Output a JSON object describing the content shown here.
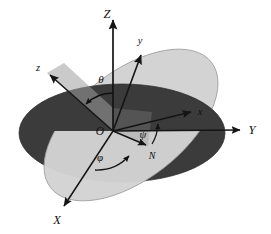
{
  "figure": {
    "name": "euler-angles-diagram",
    "background_color": "#ffffff"
  },
  "colors": {
    "fixed_plane_fill": "#3b3b3b",
    "body_plane_fill": "#d3d3d3",
    "body_plane_stroke": "#9a9a9a",
    "axis_stroke": "#151515",
    "sector_fill": "#9f9f9f",
    "ink": "#111111"
  },
  "origin": {
    "label": "O",
    "x": 113,
    "y": 131
  },
  "axes": [
    {
      "key": "Z",
      "label": "Z",
      "kind": "fixed",
      "label_x": 107,
      "label_y": 18,
      "tip_x": 113,
      "tip_y": 17,
      "tail_x": 113,
      "tail_y": 131
    },
    {
      "key": "Y",
      "label": "Y",
      "kind": "fixed",
      "label_x": 252,
      "label_y": 134,
      "tip_x": 243,
      "tip_y": 130,
      "tail_x": 113,
      "tail_y": 131
    },
    {
      "key": "X",
      "label": "X",
      "kind": "fixed",
      "label_x": 57,
      "label_y": 224,
      "tip_x": 62,
      "tip_y": 208,
      "tail_x": 113,
      "tail_y": 131
    },
    {
      "key": "z",
      "label": "z",
      "kind": "body",
      "label_x": 38,
      "label_y": 71,
      "tip_x": 47,
      "tip_y": 73,
      "tail_x": 113,
      "tail_y": 131
    },
    {
      "key": "y",
      "label": "y",
      "kind": "body",
      "label_x": 140,
      "label_y": 44,
      "tip_x": 143,
      "tip_y": 52,
      "tail_x": 113,
      "tail_y": 131
    },
    {
      "key": "x",
      "label": "x",
      "kind": "body",
      "label_x": 200,
      "label_y": 115,
      "tip_x": 194,
      "tip_y": 112,
      "tail_x": 113,
      "tail_y": 131
    },
    {
      "key": "N",
      "label": "N",
      "kind": "node",
      "label_x": 152,
      "label_y": 159,
      "tip_x": 148,
      "tip_y": 146,
      "tail_x": 113,
      "tail_y": 131
    }
  ],
  "angles": [
    {
      "key": "theta",
      "label": "θ",
      "label_x": 101,
      "label_y": 83,
      "between": [
        "Z",
        "z"
      ]
    },
    {
      "key": "phi",
      "label": "φ",
      "label_x": 100,
      "label_y": 157,
      "between": [
        "X",
        "N"
      ]
    },
    {
      "key": "psi",
      "label": "ψ",
      "label_x": 142,
      "label_y": 137,
      "between": [
        "N",
        "x"
      ]
    }
  ],
  "planes": [
    {
      "key": "fixed-plane",
      "name": "XY-plane",
      "fill": "#3b3b3b"
    },
    {
      "key": "body-plane",
      "name": "xy-plane",
      "fill": "#d3d3d3"
    }
  ]
}
